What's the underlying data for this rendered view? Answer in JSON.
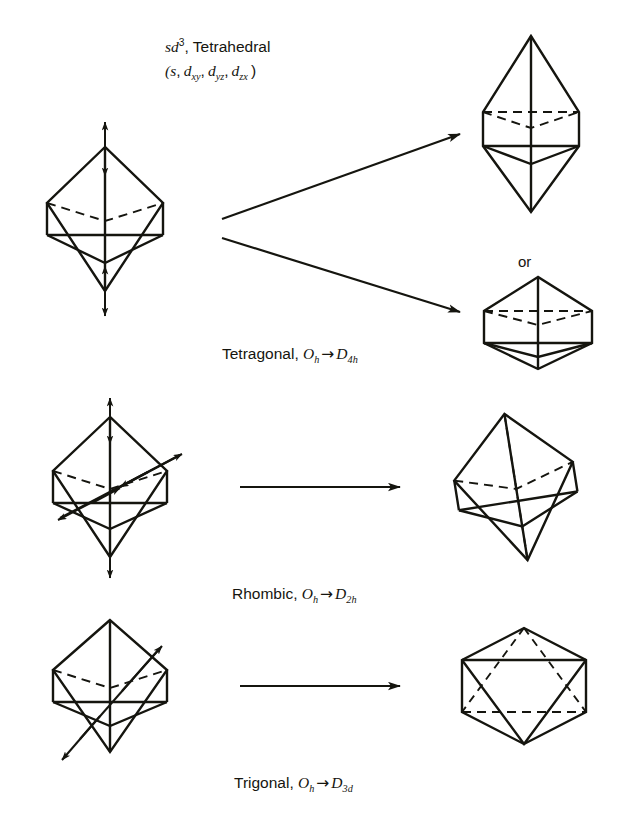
{
  "figure": {
    "title_line1_prefix": "sd",
    "title_line1_sup": "3",
    "title_line1_suffix": ", Tetrahedral",
    "title_line2": "(s, d",
    "orbitals": [
      "xy",
      "yz",
      "zx"
    ],
    "or_label": "or",
    "background_color": "#ffffff",
    "ink_color": "#15150f"
  },
  "rows": [
    {
      "name": "tetragonal",
      "caption_text": "Tetragonal,",
      "from_group": "O",
      "from_sub": "h",
      "arrow": "→",
      "to_group": "D",
      "to_sub": "4h",
      "distortion_axis": "vertical C4 axis",
      "products": [
        "elongated octahedron",
        "compressed octahedron"
      ],
      "connector": "two diverging arrows"
    },
    {
      "name": "rhombic",
      "caption_text": "Rhombic,",
      "from_group": "O",
      "from_sub": "h",
      "arrow": "→",
      "to_group": "D",
      "to_sub": "2h",
      "distortion_axis": "vertical plus one equatorial axis",
      "products": [
        "rhombically distorted octahedron"
      ],
      "connector": "single horizontal arrow"
    },
    {
      "name": "trigonal",
      "caption_text": "Trigonal,",
      "from_group": "O",
      "from_sub": "h",
      "arrow": "→",
      "to_group": "D",
      "to_sub": "3d",
      "distortion_axis": "body diagonal C3 axis",
      "products": [
        "trigonally compressed octahedron"
      ],
      "connector": "single horizontal arrow"
    }
  ]
}
